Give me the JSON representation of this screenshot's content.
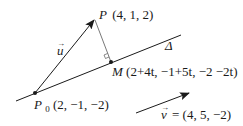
{
  "diagram": {
    "points": {
      "P": {
        "name": "P",
        "coords": "(4, 1, 2)"
      },
      "P0": {
        "name": "P",
        "subscript": "0",
        "coords": "(2, −1, −2)"
      },
      "M": {
        "name": "M",
        "coords": "(2+4t, −1+5t, −2 −2t)"
      }
    },
    "line": {
      "name": "Δ"
    },
    "vectors": {
      "u": {
        "name": "u",
        "arrow": "→"
      },
      "v": {
        "name": "v",
        "arrow": "→",
        "equals": "= (4, 5, −2)"
      }
    },
    "colors": {
      "stroke": "#1a1a1a",
      "perp": "#555555",
      "background": "#ffffff"
    }
  }
}
